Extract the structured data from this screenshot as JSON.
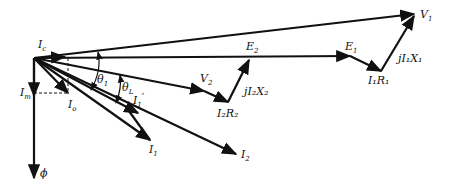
{
  "diagram": {
    "origin": [
      34,
      58
    ],
    "labels": {
      "V1": {
        "main": "V",
        "sub": "1"
      },
      "E1": {
        "main": "E",
        "sub": "1"
      },
      "E2": {
        "main": "E",
        "sub": "2"
      },
      "V2": {
        "main": "V",
        "sub": "2"
      },
      "I1R1": {
        "text": "I₁R₁"
      },
      "jI1X1": {
        "text": "jI₁X₁"
      },
      "I2R2": {
        "text": "I₂R₂"
      },
      "jI2X2": {
        "text": "jI₂X₂"
      },
      "Ic": {
        "main": "I",
        "sub": "c"
      },
      "Im": {
        "main": "I",
        "sub": "m"
      },
      "Io": {
        "main": "I",
        "sub": "o"
      },
      "I1": {
        "main": "I",
        "sub": "1"
      },
      "I2": {
        "main": "I",
        "sub": "2"
      },
      "I1prime": {
        "main": "I",
        "sub": "1",
        "sup": "′"
      },
      "phi": {
        "main": "ϕ"
      },
      "theta1": {
        "main": "θ",
        "sub": "1"
      },
      "thetaL": {
        "main": "θ",
        "sub": "L"
      }
    }
  }
}
